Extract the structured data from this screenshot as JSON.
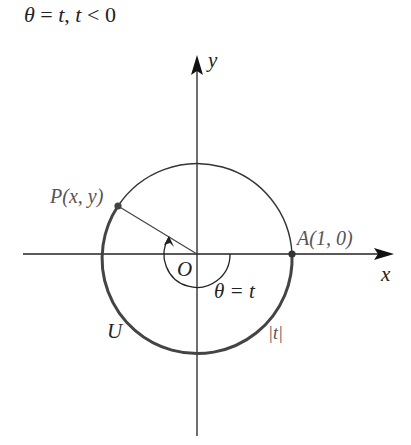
{
  "title": {
    "theta": "θ",
    "eq": " = ",
    "t1": "t",
    "comma": ", ",
    "t2": "t",
    "rel": " < 0"
  },
  "labels": {
    "y_axis": "y",
    "x_axis": "x",
    "point_P": "P(x, y)",
    "point_A": "A(1, 0)",
    "origin": "O",
    "angle": "θ = t",
    "circle": "U",
    "arc_length": "|t|"
  },
  "geometry": {
    "origin": [
      197,
      254
    ],
    "radius": 95,
    "point_P": [
      118,
      206
    ],
    "point_A": [
      292,
      254
    ],
    "angle_arc_radius": 33
  },
  "colors": {
    "ink": "#222222",
    "thick_arc": "#444444",
    "point": "#444444"
  }
}
